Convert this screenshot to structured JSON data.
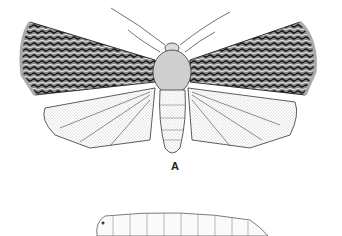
{
  "figure": {
    "subjects": [
      {
        "name": "adult-moth",
        "description": "dorsal view of moth with wings spread, patterned forewings, stippled hindwings"
      },
      {
        "name": "larva",
        "description": "segmented caterpillar, lateral view"
      }
    ],
    "label": "A",
    "colors": {
      "ink": "#1a1a1a",
      "background": "#ffffff",
      "stipple": "#777777"
    }
  }
}
